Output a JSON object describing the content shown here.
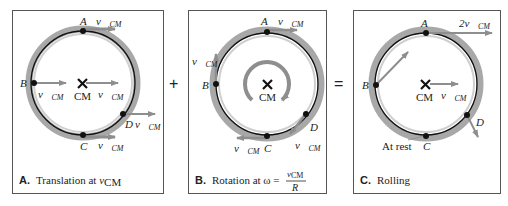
{
  "panels": [
    {
      "id": "A",
      "caption_letter": "A.",
      "caption_text": "Translation at ",
      "caption_var": "v",
      "caption_sub": "CM",
      "points": {
        "A": "A",
        "B": "B",
        "C": "C",
        "D": "D",
        "CM": "CM"
      },
      "velocity_labels": {
        "A": "v⃗",
        "B": "v⃗",
        "C": "v⃗",
        "D": "v⃗",
        "CM": "v⃗"
      },
      "velocity_sub": "CM"
    },
    {
      "id": "B",
      "caption_letter": "B.",
      "caption_text": "Rotation at ω = ",
      "caption_frac_num": "v",
      "caption_frac_num_sub": "CM",
      "caption_frac_den": "R",
      "points": {
        "A": "A",
        "B": "B",
        "C": "C",
        "D": "D",
        "CM": "CM"
      },
      "velocity_labels": {
        "A": "v⃗",
        "B": "v⃗",
        "C": "v⃗",
        "D": "v⃗"
      },
      "velocity_sub": "CM"
    },
    {
      "id": "C",
      "caption_letter": "C.",
      "caption_text": "Rolling",
      "points": {
        "A": "A",
        "B": "B",
        "C": "C",
        "D": "D",
        "CM": "CM"
      },
      "velocity_labels": {
        "A": "2v⃗",
        "CM": "v⃗"
      },
      "velocity_sub": "CM",
      "at_rest": "At rest"
    }
  ],
  "operators": {
    "plus": "+",
    "equals": "="
  },
  "colors": {
    "arrow": "#8e8e8e",
    "ring": "#a8a8a8",
    "ring_inner": "#c8c8c8",
    "line": "#111111",
    "box": "#555555"
  }
}
